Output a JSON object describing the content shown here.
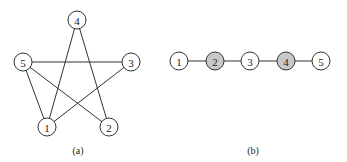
{
  "colors": {
    "node_default": "#ffffff",
    "node_shaded": "#c8c8c8",
    "stroke": "#333333"
  },
  "graph_a": {
    "caption": "(a)",
    "nodes": [
      {
        "id": "1",
        "label": "1",
        "x": 47,
        "y": 127,
        "shaded": false
      },
      {
        "id": "2",
        "label": "2",
        "x": 109,
        "y": 127,
        "shaded": false
      },
      {
        "id": "3",
        "label": "3",
        "x": 131,
        "y": 62,
        "shaded": false
      },
      {
        "id": "4",
        "label": "4",
        "x": 77,
        "y": 20,
        "shaded": false
      },
      {
        "id": "5",
        "label": "5",
        "x": 23,
        "y": 62,
        "shaded": false
      }
    ],
    "edges": [
      [
        "4",
        "1"
      ],
      [
        "4",
        "2"
      ],
      [
        "5",
        "3"
      ],
      [
        "5",
        "1"
      ],
      [
        "5",
        "2"
      ],
      [
        "3",
        "1"
      ]
    ]
  },
  "graph_b": {
    "caption": "(b)",
    "nodes": [
      {
        "id": "1",
        "label": "1",
        "x": 179,
        "y": 61,
        "shaded": false
      },
      {
        "id": "2",
        "label": "2",
        "x": 215,
        "y": 61,
        "shaded": true
      },
      {
        "id": "3",
        "label": "3",
        "x": 250,
        "y": 61,
        "shaded": false
      },
      {
        "id": "4",
        "label": "4",
        "x": 286,
        "y": 61,
        "shaded": true
      },
      {
        "id": "5",
        "label": "5",
        "x": 321,
        "y": 61,
        "shaded": false
      }
    ],
    "edges": [
      [
        "1",
        "2"
      ],
      [
        "2",
        "3"
      ],
      [
        "3",
        "4"
      ],
      [
        "4",
        "5"
      ]
    ]
  }
}
